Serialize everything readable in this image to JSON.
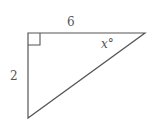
{
  "figure": {
    "type": "right-triangle",
    "line_color": "#555555",
    "vertices": {
      "right_angle": [
        28,
        33
      ],
      "top_right": [
        145,
        33
      ],
      "bottom_left": [
        28,
        118
      ]
    },
    "labels": {
      "top_side": "6",
      "left_side": "2",
      "angle": "x°"
    },
    "right_angle_marker": true
  }
}
